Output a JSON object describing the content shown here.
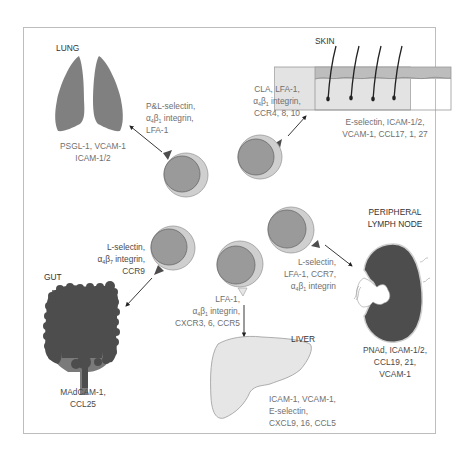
{
  "diagram": {
    "colors": {
      "organ_dark": "#4d4d4d",
      "organ_mid": "#7a7a7a",
      "lung": "#808080",
      "liver": "#e6e6e6",
      "skin_dermis": "#e3e3e3",
      "skin_epidermis": "#bdbdbd",
      "cell_outer": "#cfcfcf",
      "cell_inner": "#9a9a9a",
      "text": "#6f6f6f",
      "frame": "#bdbdbd"
    },
    "organs": {
      "lung": {
        "title": "LUNG",
        "ligands": [
          "PSGL-1, VCAM-1",
          "ICAM-1/2"
        ],
        "receptors": [
          "P&L-selectin,",
          "α4β1 integrin,",
          "LFA-1"
        ]
      },
      "skin": {
        "title": "SKIN",
        "ligands": [
          "E-selectin, ICAM-1/2,",
          "VCAM-1, CCL17, 1, 27"
        ],
        "receptors": [
          "CLA, LFA-1,",
          "α4β1 integrin,",
          "CCR4, 8, 10"
        ]
      },
      "gut": {
        "title": "GUT",
        "ligands": [
          "MAdCAM-1,",
          "CCL25"
        ],
        "receptors": [
          "L-selectin,",
          "α4β7 integrin,",
          "CCR9"
        ]
      },
      "liver": {
        "title": "LIVER",
        "ligands": [
          "ICAM-1, VCAM-1,",
          "E-selectin,",
          "CXCL9, 16, CCL5"
        ],
        "receptors": [
          "LFA-1,",
          "α4β1 integrin,",
          "CXCR3, 6, CCR5"
        ]
      },
      "lymph_node": {
        "title": [
          "PERIPHERAL",
          "LYMPH NODE"
        ],
        "ligands": [
          "PNAd, ICAM-1/2,",
          "CCL19, 21,",
          "VCAM-1"
        ],
        "receptors": [
          "L-selectin,",
          "LFA-1, CCR7,",
          "α4β1 integrin"
        ]
      }
    }
  }
}
